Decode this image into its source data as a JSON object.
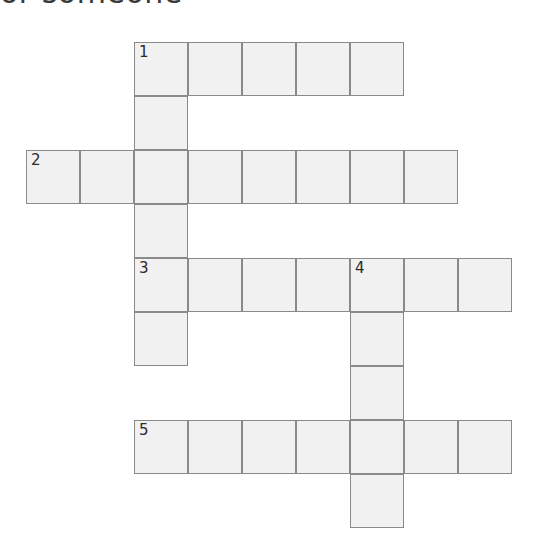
{
  "page": {
    "background_color": "#ffffff"
  },
  "clue_heading": {
    "text": "or someone",
    "note": "clipped at top edge of screenshot"
  },
  "grid": {
    "cell_size": 54,
    "origin_x": 26,
    "origin_y": 42,
    "cell_fill_color": "#f1f1f1",
    "cell_border_color": "#8a8a8a",
    "number_color": "#2b2b2b",
    "columns": 9,
    "rows": 10
  },
  "entries": [
    {
      "number": "1",
      "direction": "across",
      "row": 0,
      "col": 2,
      "length": 5
    },
    {
      "number": "1",
      "direction": "down",
      "row": 0,
      "col": 2,
      "length": 6
    },
    {
      "number": "2",
      "direction": "across",
      "row": 2,
      "col": 0,
      "length": 8
    },
    {
      "number": "3",
      "direction": "across",
      "row": 4,
      "col": 2,
      "length": 7
    },
    {
      "number": "4",
      "direction": "down",
      "row": 4,
      "col": 6,
      "length": 5
    },
    {
      "number": "5",
      "direction": "across",
      "row": 7,
      "col": 2,
      "length": 7
    }
  ],
  "cells": [
    {
      "row": 0,
      "col": 2,
      "number": "1"
    },
    {
      "row": 0,
      "col": 3,
      "number": ""
    },
    {
      "row": 0,
      "col": 4,
      "number": ""
    },
    {
      "row": 0,
      "col": 5,
      "number": ""
    },
    {
      "row": 0,
      "col": 6,
      "number": ""
    },
    {
      "row": 1,
      "col": 2,
      "number": ""
    },
    {
      "row": 2,
      "col": 0,
      "number": "2"
    },
    {
      "row": 2,
      "col": 1,
      "number": ""
    },
    {
      "row": 2,
      "col": 2,
      "number": ""
    },
    {
      "row": 2,
      "col": 3,
      "number": ""
    },
    {
      "row": 2,
      "col": 4,
      "number": ""
    },
    {
      "row": 2,
      "col": 5,
      "number": ""
    },
    {
      "row": 2,
      "col": 6,
      "number": ""
    },
    {
      "row": 2,
      "col": 7,
      "number": ""
    },
    {
      "row": 3,
      "col": 2,
      "number": ""
    },
    {
      "row": 4,
      "col": 2,
      "number": "3"
    },
    {
      "row": 4,
      "col": 3,
      "number": ""
    },
    {
      "row": 4,
      "col": 4,
      "number": ""
    },
    {
      "row": 4,
      "col": 5,
      "number": ""
    },
    {
      "row": 4,
      "col": 6,
      "number": "4"
    },
    {
      "row": 4,
      "col": 7,
      "number": ""
    },
    {
      "row": 4,
      "col": 8,
      "number": ""
    },
    {
      "row": 5,
      "col": 2,
      "number": ""
    },
    {
      "row": 5,
      "col": 6,
      "number": ""
    },
    {
      "row": 6,
      "col": 6,
      "number": ""
    },
    {
      "row": 7,
      "col": 2,
      "number": "5"
    },
    {
      "row": 7,
      "col": 3,
      "number": ""
    },
    {
      "row": 7,
      "col": 4,
      "number": ""
    },
    {
      "row": 7,
      "col": 5,
      "number": ""
    },
    {
      "row": 7,
      "col": 6,
      "number": ""
    },
    {
      "row": 7,
      "col": 7,
      "number": ""
    },
    {
      "row": 7,
      "col": 8,
      "number": ""
    },
    {
      "row": 8,
      "col": 6,
      "number": ""
    }
  ]
}
